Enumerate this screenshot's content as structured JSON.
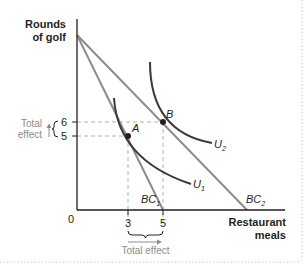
{
  "diagram": {
    "y_axis_title_line1": "Rounds",
    "y_axis_title_line2": "of golf",
    "x_axis_title_line1": "Restaurant",
    "x_axis_title_line2": "meals",
    "origin": "0",
    "y_ticks": [
      "6",
      "5"
    ],
    "x_ticks": [
      "3",
      "5"
    ],
    "points": [
      {
        "label": "A",
        "x": 3,
        "y": 5
      },
      {
        "label": "B",
        "x": 5,
        "y": 6
      }
    ],
    "curves": {
      "u1": {
        "base": "U",
        "sub": "1"
      },
      "u2": {
        "base": "U",
        "sub": "2"
      },
      "bc1": {
        "base": "BC",
        "sub": "1"
      },
      "bc2": {
        "base": "BC",
        "sub": "2"
      }
    },
    "total_effect_y_line1": "Total",
    "total_effect_y_line2": "effect",
    "total_effect_x": "Total effect"
  },
  "colors": {
    "axis": "#231f20",
    "budget_line": "#8a8c8e",
    "indifference_curve": "#3a3a3c",
    "dashed": "#b0b2b4",
    "annotation": "#8a8c8e",
    "border_dotted": "#c8c9ca"
  }
}
